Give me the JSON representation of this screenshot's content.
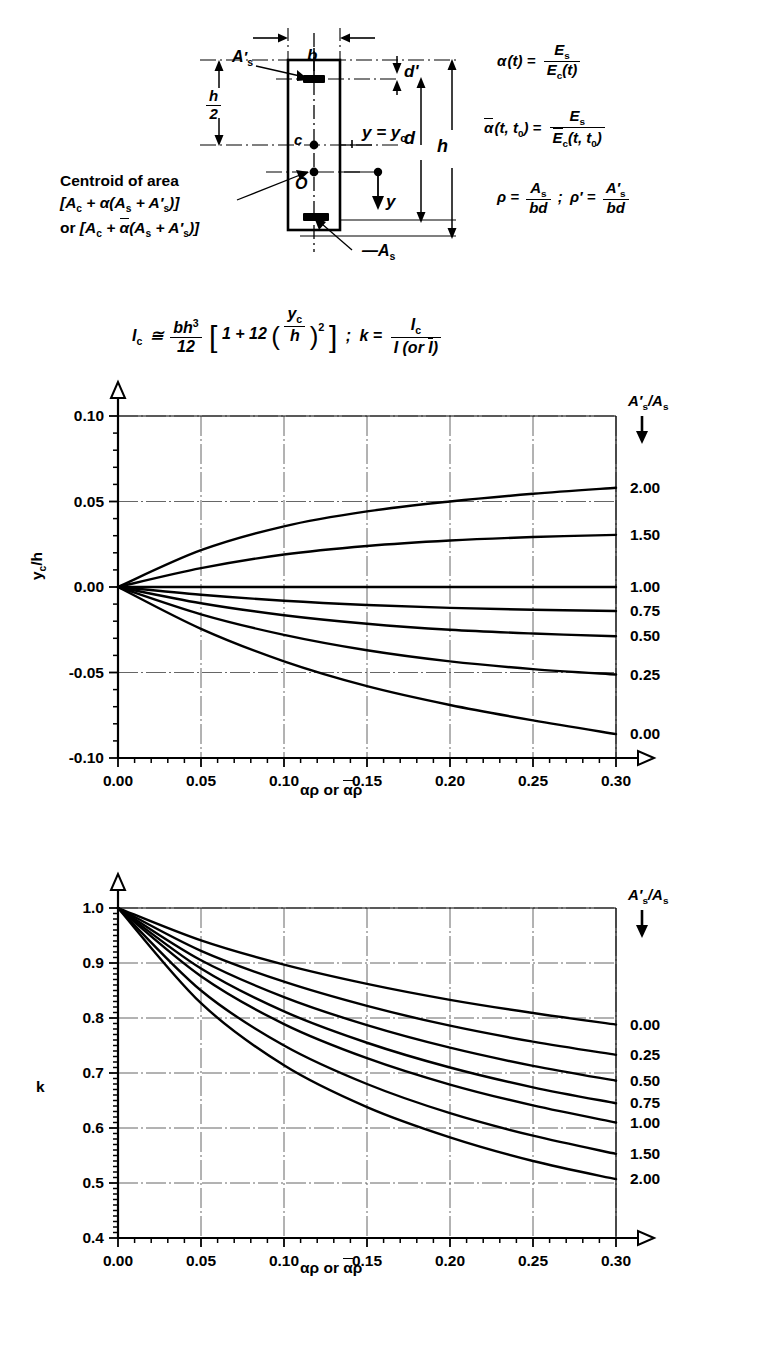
{
  "diagram": {
    "labels": {
      "b": "b",
      "d_prime": "d'",
      "h_over_2_num": "h",
      "h_over_2_den": "2",
      "c": "c",
      "O": "O",
      "d": "d",
      "h": "h",
      "y": "y",
      "y_eq_yc": "y = y",
      "y_eq_yc_sub": "c",
      "As_prime": "A's",
      "As": "As",
      "centroid_line1": "Centroid of area",
      "centroid_line2": "[Aₓ + α(Aₛ + A'ₛ)]",
      "centroid_line3": "or [Aₓ + ᾱ(Aₛ + A'ₛ)]"
    },
    "equations": {
      "alpha": {
        "lhs": "α(t) =",
        "num": "Es",
        "den": "Ec(t)"
      },
      "alpha_bar": {
        "lhs": "ᾱ(t, t₀) =",
        "num": "Es",
        "den": "Ēc(t, t₀)"
      },
      "rho": {
        "lhs": "ρ =",
        "num": "As",
        "den": "bd",
        "sep": ";",
        "lhs2": "ρ' =",
        "num2": "A's",
        "den2": "bd"
      },
      "Ic": {
        "lhs": "Ic ≅",
        "num": "bh³",
        "den": "12",
        "bracket_open": "[",
        "inner": "1 + 12",
        "paren_num": "yc",
        "paren_den": "h",
        "power": "2",
        "bracket_close": "]",
        "semicolon": ";",
        "k_lhs": "k =",
        "k_num": "Ic",
        "k_den": "I (or Ī)"
      }
    }
  },
  "chart_data": [
    {
      "id": "chart-yc-h",
      "type": "line",
      "title": "",
      "xlabel": "αρ or ᾱρ",
      "ylabel": "yc/h",
      "legend_title": "A's/As",
      "legend_position": "right-of-axes",
      "grid": true,
      "xlim": [
        0.0,
        0.3
      ],
      "ylim": [
        -0.1,
        0.1
      ],
      "xticks": [
        0.0,
        0.05,
        0.1,
        0.15,
        0.2,
        0.25,
        0.3
      ],
      "xticklabels": [
        "0.00",
        "0.05",
        "0.10",
        "0.15",
        "0.20",
        "0.25",
        "0.30"
      ],
      "yticks": [
        -0.1,
        -0.05,
        0.0,
        0.05,
        0.1
      ],
      "yticklabels": [
        "-0.10",
        "-0.05",
        "0.00",
        "0.05",
        "0.10"
      ],
      "x": [
        0.0,
        0.05,
        0.1,
        0.15,
        0.2,
        0.25,
        0.3
      ],
      "series": [
        {
          "name": "2.00",
          "values": [
            0.0,
            0.0215,
            0.0355,
            0.0442,
            0.05,
            0.0545,
            0.058
          ]
        },
        {
          "name": "1.50",
          "values": [
            0.0,
            0.011,
            0.019,
            0.024,
            0.0272,
            0.0292,
            0.0305
          ]
        },
        {
          "name": "1.00",
          "values": [
            0.0,
            0.0,
            0.0,
            0.0,
            0.0,
            0.0,
            0.0
          ]
        },
        {
          "name": "0.75",
          "values": [
            0.0,
            -0.0045,
            -0.008,
            -0.0105,
            -0.0122,
            -0.0133,
            -0.014
          ]
        },
        {
          "name": "0.50",
          "values": [
            0.0,
            -0.0095,
            -0.0165,
            -0.0215,
            -0.025,
            -0.0272,
            -0.0288
          ]
        },
        {
          "name": "0.25",
          "values": [
            0.0,
            -0.016,
            -0.028,
            -0.037,
            -0.0435,
            -0.048,
            -0.0512
          ]
        },
        {
          "name": "0.00",
          "values": [
            0.0,
            -0.0245,
            -0.0435,
            -0.058,
            -0.069,
            -0.078,
            -0.086
          ]
        }
      ]
    },
    {
      "id": "chart-k",
      "type": "line",
      "title": "",
      "xlabel": "αρ or ᾱρ",
      "ylabel": "k",
      "legend_title": "A's/As",
      "legend_position": "right-of-axes",
      "grid": true,
      "xlim": [
        0.0,
        0.3
      ],
      "ylim": [
        0.4,
        1.0
      ],
      "xticks": [
        0.0,
        0.05,
        0.1,
        0.15,
        0.2,
        0.25,
        0.3
      ],
      "xticklabels": [
        "0.00",
        "0.05",
        "0.10",
        "0.15",
        "0.20",
        "0.25",
        "0.30"
      ],
      "yticks": [
        0.4,
        0.5,
        0.6,
        0.7,
        0.8,
        0.9,
        1.0
      ],
      "yticklabels": [
        "0.4",
        "0.5",
        "0.6",
        "0.7",
        "0.8",
        "0.9",
        "1.0"
      ],
      "x": [
        0.0,
        0.05,
        0.1,
        0.15,
        0.2,
        0.25,
        0.3
      ],
      "series": [
        {
          "name": "0.00",
          "values": [
            1.0,
            0.941,
            0.897,
            0.862,
            0.833,
            0.809,
            0.788
          ]
        },
        {
          "name": "0.25",
          "values": [
            1.0,
            0.922,
            0.866,
            0.822,
            0.786,
            0.757,
            0.733
          ]
        },
        {
          "name": "0.50",
          "values": [
            1.0,
            0.905,
            0.838,
            0.787,
            0.746,
            0.713,
            0.686
          ]
        },
        {
          "name": "0.75",
          "values": [
            1.0,
            0.89,
            0.812,
            0.755,
            0.71,
            0.674,
            0.645
          ]
        },
        {
          "name": "1.00",
          "values": [
            1.0,
            0.876,
            0.789,
            0.727,
            0.679,
            0.641,
            0.61
          ]
        },
        {
          "name": "1.50",
          "values": [
            1.0,
            0.85,
            0.75,
            0.68,
            0.627,
            0.586,
            0.553
          ]
        },
        {
          "name": "2.00",
          "values": [
            1.0,
            0.827,
            0.714,
            0.638,
            0.583,
            0.54,
            0.507
          ]
        }
      ]
    }
  ]
}
